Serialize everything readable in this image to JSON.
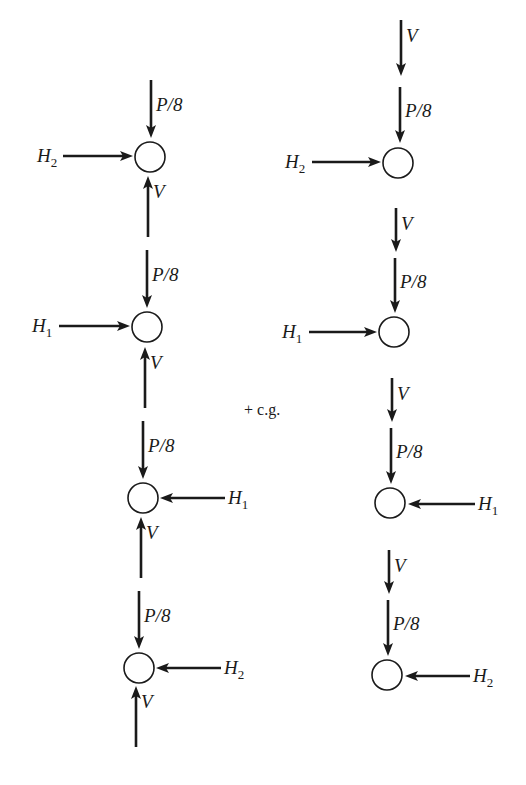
{
  "diagram": {
    "type": "free-body-diagram",
    "colors": {
      "ink": "#1a1a1a",
      "background": "#ffffff"
    },
    "center_label": "+ c.g.",
    "left_column": {
      "nodes": [
        {
          "id": "L1",
          "cx": 150,
          "cy": 157,
          "r": 15
        },
        {
          "id": "L2",
          "cx": 147,
          "cy": 327,
          "r": 15
        },
        {
          "id": "L3",
          "cx": 143,
          "cy": 498,
          "r": 15
        },
        {
          "id": "L4",
          "cx": 139,
          "cy": 668,
          "r": 15
        }
      ],
      "vertical_forces": [
        {
          "label": "P/8",
          "dir": "down",
          "x": 151,
          "y1": 80,
          "y2": 138
        },
        {
          "label": "V",
          "dir": "up",
          "x": 148,
          "y1": 237,
          "y2": 176
        },
        {
          "label": "P/8",
          "dir": "down",
          "x": 147,
          "y1": 250,
          "y2": 308
        },
        {
          "label": "V",
          "dir": "up",
          "x": 145,
          "y1": 408,
          "y2": 347
        },
        {
          "label": "P/8",
          "dir": "down",
          "x": 143,
          "y1": 421,
          "y2": 479
        },
        {
          "label": "V",
          "dir": "up",
          "x": 141,
          "y1": 578,
          "y2": 517
        },
        {
          "label": "P/8",
          "dir": "down",
          "x": 139,
          "y1": 591,
          "y2": 649
        },
        {
          "label": "V",
          "dir": "up",
          "x": 136,
          "y1": 747,
          "y2": 686
        }
      ],
      "horizontal_forces": [
        {
          "label": "H",
          "sub": "2",
          "dir": "right",
          "y": 156,
          "x1": 63,
          "x2": 133,
          "label_x": 37,
          "label_side": "left"
        },
        {
          "label": "H",
          "sub": "1",
          "dir": "right",
          "y": 326,
          "x1": 59,
          "x2": 130,
          "label_x": 32,
          "label_side": "left"
        },
        {
          "label": "H",
          "sub": "1",
          "dir": "left",
          "y": 498,
          "x1": 225,
          "x2": 160,
          "label_x": 228,
          "label_side": "right"
        },
        {
          "label": "H",
          "sub": "2",
          "dir": "left",
          "y": 668,
          "x1": 221,
          "x2": 156,
          "label_x": 224,
          "label_side": "right"
        }
      ]
    },
    "right_column": {
      "nodes": [
        {
          "id": "R1",
          "cx": 398,
          "cy": 163,
          "r": 15
        },
        {
          "id": "R2",
          "cx": 394,
          "cy": 332,
          "r": 15
        },
        {
          "id": "R3",
          "cx": 390,
          "cy": 503,
          "r": 15
        },
        {
          "id": "R4",
          "cx": 387,
          "cy": 675,
          "r": 15
        }
      ],
      "vertical_forces": [
        {
          "label": "V",
          "dir": "down",
          "x": 401,
          "y1": 20,
          "y2": 76
        },
        {
          "label": "P/8",
          "dir": "down",
          "x": 400,
          "y1": 87,
          "y2": 143
        },
        {
          "label": "V",
          "dir": "down",
          "x": 396,
          "y1": 208,
          "y2": 252
        },
        {
          "label": "P/8",
          "dir": "down",
          "x": 395,
          "y1": 258,
          "y2": 313
        },
        {
          "label": "V",
          "dir": "down",
          "x": 392,
          "y1": 378,
          "y2": 422
        },
        {
          "label": "P/8",
          "dir": "down",
          "x": 391,
          "y1": 428,
          "y2": 484
        },
        {
          "label": "V",
          "dir": "down",
          "x": 389,
          "y1": 550,
          "y2": 594
        },
        {
          "label": "P/8",
          "dir": "down",
          "x": 388,
          "y1": 600,
          "y2": 656
        }
      ],
      "horizontal_forces": [
        {
          "label": "H",
          "sub": "2",
          "dir": "right",
          "y": 162,
          "x1": 312,
          "x2": 381,
          "label_x": 285,
          "label_side": "left"
        },
        {
          "label": "H",
          "sub": "1",
          "dir": "right",
          "y": 332,
          "x1": 309,
          "x2": 377,
          "label_x": 282,
          "label_side": "left"
        },
        {
          "label": "H",
          "sub": "1",
          "dir": "left",
          "y": 504,
          "x1": 475,
          "x2": 408,
          "label_x": 478,
          "label_side": "right"
        },
        {
          "label": "H",
          "sub": "2",
          "dir": "left",
          "y": 676,
          "x1": 470,
          "x2": 405,
          "label_x": 473,
          "label_side": "right"
        }
      ]
    }
  }
}
